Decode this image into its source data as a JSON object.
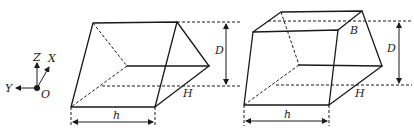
{
  "figure": {
    "axes": {
      "labels": {
        "z": "Z",
        "x": "X",
        "y": "Y",
        "origin": "O"
      }
    },
    "model_left": {
      "labels": {
        "depth": "D",
        "height": "H",
        "width": "h"
      }
    },
    "model_right": {
      "labels": {
        "top": "B",
        "depth": "D",
        "height": "H",
        "width": "h"
      }
    },
    "colors": {
      "line": "#1a1a1a",
      "background": "#ffffff"
    }
  }
}
